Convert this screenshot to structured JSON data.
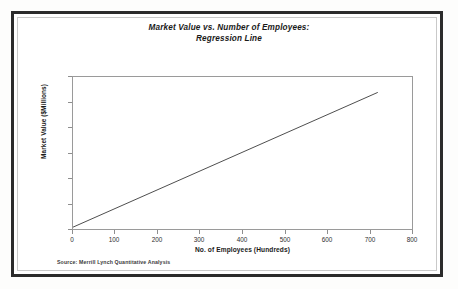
{
  "chart_data": {
    "type": "line",
    "title": "Market Value vs. Number of Employees:\nRegression Line",
    "title_line1": "Market Value vs. Number of Employees:",
    "title_line2": "Regression Line",
    "xlabel": "No. of Employees (Hundreds)",
    "ylabel": "Market Value ($Millions)",
    "xlim": [
      0,
      800
    ],
    "ylim": [
      0,
      60000
    ],
    "xticks": [
      0,
      100,
      200,
      300,
      400,
      500,
      600,
      700,
      800
    ],
    "xtick_labels": [
      "0",
      "100",
      "200",
      "300",
      "400",
      "500",
      "600",
      "700",
      "800"
    ],
    "yticks": [
      0,
      10000,
      20000,
      30000,
      40000,
      50000,
      60000
    ],
    "ytick_labels": [
      "0",
      "10000",
      "20000",
      "30000",
      "40000",
      "50000",
      "60000"
    ],
    "grid": false,
    "legend": false,
    "line_color": "#3a3a3a",
    "series": [
      {
        "name": "Regression Line",
        "x": [
          0,
          100,
          200,
          300,
          400,
          500,
          600,
          715
        ],
        "values": [
          1500,
          8840,
          16180,
          23520,
          30860,
          38200,
          45540,
          54000
        ]
      }
    ],
    "annotations": {
      "source": "Source: Merrill Lynch Quantitative Analysis"
    }
  }
}
